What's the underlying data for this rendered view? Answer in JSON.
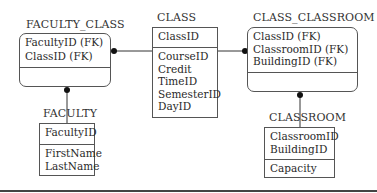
{
  "diagram": {
    "type": "entity-relationship",
    "entities": [
      {
        "id": "faculty_class",
        "title": "FACULTY_CLASS",
        "shape": "rounded",
        "key_attributes": [
          "FacultyID (FK)",
          "ClassID (FK)"
        ],
        "attributes": []
      },
      {
        "id": "class",
        "title": "CLASS",
        "shape": "square",
        "key_attributes": [
          "ClassID"
        ],
        "attributes": [
          "CourseID",
          "Credit",
          "TimeID",
          "SemesterID",
          "DayID"
        ]
      },
      {
        "id": "class_classroom",
        "title": "CLASS_CLASSROOM",
        "shape": "rounded",
        "key_attributes": [
          "ClassID (FK)",
          "ClassroomID (FK)",
          "BuildingID (FK)"
        ],
        "attributes": []
      },
      {
        "id": "faculty",
        "title": "FACULTY",
        "shape": "square",
        "key_attributes": [
          "FacultyID"
        ],
        "attributes": [
          "FirstName",
          "LastName"
        ]
      },
      {
        "id": "classroom",
        "title": "CLASSROOM",
        "shape": "square",
        "key_attributes": [
          "ClassroomID",
          "BuildingID"
        ],
        "attributes": [
          "Capacity"
        ]
      }
    ],
    "relationships": [
      {
        "from": "class",
        "to": "faculty_class",
        "end": "dot-at-faculty_class"
      },
      {
        "from": "class",
        "to": "class_classroom",
        "end": "dot-at-class_classroom"
      },
      {
        "from": "faculty",
        "to": "faculty_class",
        "end": "dot-at-faculty_class"
      },
      {
        "from": "classroom",
        "to": "class_classroom",
        "end": "dot-at-class_classroom"
      }
    ],
    "colors": {
      "line": "#333333",
      "border": "#555555",
      "text": "#2a2a2a"
    }
  }
}
